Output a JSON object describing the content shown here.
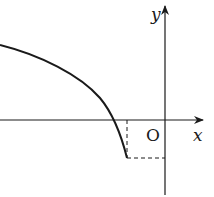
{
  "diagram": {
    "type": "function-graph",
    "labels": {
      "origin": "O",
      "x_axis": "x",
      "y_axis": "y"
    },
    "colors": {
      "stroke": "#1a1a1a",
      "background": "#ffffff"
    },
    "elements": [
      {
        "kind": "axis",
        "name": "x-axis",
        "direction": "horizontal",
        "arrow": "right"
      },
      {
        "kind": "axis",
        "name": "y-axis",
        "direction": "vertical",
        "arrow": "up"
      },
      {
        "kind": "curve",
        "name": "function-curve",
        "description": "decreasing concave-down curve from upper left, crossing negative x-axis, ending below x-axis left of the origin"
      },
      {
        "kind": "dashed-line",
        "name": "vertical-guide",
        "description": "from curve endpoint up to x-axis"
      },
      {
        "kind": "dashed-line",
        "name": "horizontal-guide",
        "description": "from curve endpoint right to y-axis"
      }
    ]
  }
}
